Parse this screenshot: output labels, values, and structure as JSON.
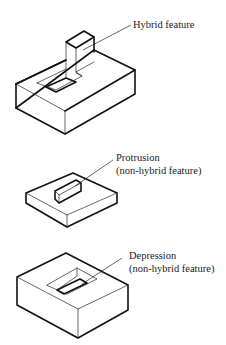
{
  "figure": {
    "type": "isometric feature illustrations",
    "stroke_color": "#111111",
    "background": "#ffffff"
  },
  "figures": [
    {
      "id": "hybrid",
      "label_lines": [
        "Hybrid feature"
      ],
      "description": "block with a pocket and an upright column rising from the pocket"
    },
    {
      "id": "protrusion",
      "label_lines": [
        "Protrusion",
        "(non-hybrid feature)"
      ],
      "description": "thin plate with a small raised box on top"
    },
    {
      "id": "depression",
      "label_lines": [
        "Depression",
        "(non-hybrid feature)"
      ],
      "description": "thick block with a rectangular pocket cut into the top"
    }
  ]
}
